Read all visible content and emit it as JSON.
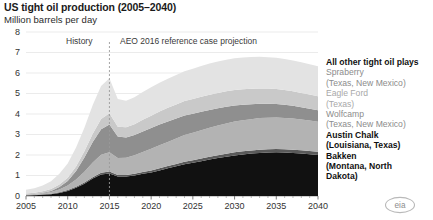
{
  "header": {
    "title": "US tight oil production (2005–2040)",
    "subtitle": "Million barrels per day"
  },
  "annotations": {
    "history": "History",
    "projection": "AEO 2016 reference case projection",
    "divider_year": 2015
  },
  "branding": {
    "logo_text": "eia"
  },
  "legend": [
    {
      "label": "All other tight oil plays",
      "sublabel": "",
      "color": "#e3e3e3",
      "tone": "dark"
    },
    {
      "label": "Spraberry",
      "sublabel": "(Texas, New Mexico)",
      "color": "#c9c9c9",
      "tone": "light"
    },
    {
      "label": "Eagle Ford",
      "sublabel": "(Texas)",
      "color": "#8f8f8f",
      "tone": "lighter"
    },
    {
      "label": "Wolfcamp",
      "sublabel": "(Texas, New Mexico)",
      "color": "#b3b3b3",
      "tone": "light"
    },
    {
      "label": "Austin Chalk",
      "sublabel": "(Louisiana, Texas)",
      "color": "#5a5a5a",
      "tone": "dark"
    },
    {
      "label": "Bakken",
      "sublabel": "(Montana, North Dakota)",
      "color": "#111111",
      "tone": "dark"
    }
  ],
  "chart_data": {
    "type": "area",
    "stacked": true,
    "title": "US tight oil production (2005–2040)",
    "subtitle": "Million barrels per day",
    "xlabel": "",
    "ylabel": "Million barrels per day",
    "xlim": [
      2005,
      2040
    ],
    "ylim": [
      0,
      8
    ],
    "yticks": [
      0,
      1,
      2,
      3,
      4,
      5,
      6,
      7,
      8
    ],
    "xticks": [
      2005,
      2010,
      2015,
      2020,
      2025,
      2030,
      2035,
      2040
    ],
    "grid": true,
    "legend_position": "right",
    "x": [
      2005,
      2006,
      2007,
      2008,
      2009,
      2010,
      2011,
      2012,
      2013,
      2014,
      2015,
      2016,
      2017,
      2018,
      2019,
      2020,
      2021,
      2022,
      2023,
      2024,
      2025,
      2026,
      2027,
      2028,
      2029,
      2030,
      2031,
      2032,
      2033,
      2034,
      2035,
      2036,
      2037,
      2038,
      2039,
      2040
    ],
    "series": [
      {
        "name": "Bakken",
        "color": "#111111",
        "values": [
          0.03,
          0.04,
          0.06,
          0.09,
          0.15,
          0.25,
          0.4,
          0.6,
          0.85,
          1.05,
          1.1,
          0.95,
          0.95,
          1.0,
          1.08,
          1.15,
          1.25,
          1.35,
          1.45,
          1.55,
          1.62,
          1.7,
          1.78,
          1.85,
          1.92,
          1.98,
          2.03,
          2.07,
          2.1,
          2.12,
          2.13,
          2.12,
          2.1,
          2.07,
          2.04,
          2.0
        ]
      },
      {
        "name": "Austin Chalk",
        "color": "#5a5a5a",
        "values": [
          0.01,
          0.01,
          0.02,
          0.02,
          0.03,
          0.04,
          0.05,
          0.06,
          0.07,
          0.08,
          0.09,
          0.08,
          0.08,
          0.09,
          0.09,
          0.1,
          0.1,
          0.11,
          0.11,
          0.12,
          0.12,
          0.13,
          0.13,
          0.14,
          0.14,
          0.15,
          0.15,
          0.15,
          0.16,
          0.16,
          0.16,
          0.16,
          0.16,
          0.16,
          0.16,
          0.16
        ]
      },
      {
        "name": "Wolfcamp",
        "color": "#b3b3b3",
        "values": [
          0.02,
          0.03,
          0.05,
          0.08,
          0.14,
          0.22,
          0.35,
          0.52,
          0.72,
          0.88,
          0.95,
          0.82,
          0.84,
          0.9,
          0.98,
          1.05,
          1.12,
          1.18,
          1.24,
          1.3,
          1.34,
          1.38,
          1.42,
          1.45,
          1.48,
          1.5,
          1.52,
          1.53,
          1.54,
          1.54,
          1.54,
          1.53,
          1.52,
          1.5,
          1.48,
          1.46
        ]
      },
      {
        "name": "Eagle Ford",
        "color": "#8f8f8f",
        "values": [
          0.01,
          0.02,
          0.03,
          0.06,
          0.12,
          0.22,
          0.42,
          0.7,
          1.0,
          1.25,
          1.35,
          1.05,
          0.98,
          0.98,
          1.0,
          1.02,
          1.02,
          1.0,
          0.98,
          0.96,
          0.93,
          0.9,
          0.87,
          0.84,
          0.81,
          0.78,
          0.75,
          0.72,
          0.7,
          0.68,
          0.66,
          0.64,
          0.62,
          0.6,
          0.58,
          0.56
        ]
      },
      {
        "name": "Spraberry",
        "color": "#c9c9c9",
        "values": [
          0.05,
          0.06,
          0.07,
          0.09,
          0.12,
          0.16,
          0.22,
          0.3,
          0.4,
          0.5,
          0.55,
          0.48,
          0.5,
          0.53,
          0.57,
          0.6,
          0.63,
          0.66,
          0.68,
          0.7,
          0.72,
          0.73,
          0.74,
          0.75,
          0.76,
          0.76,
          0.76,
          0.76,
          0.75,
          0.74,
          0.73,
          0.72,
          0.71,
          0.7,
          0.69,
          0.68
        ]
      },
      {
        "name": "All other tight oil plays",
        "color": "#e3e3e3",
        "values": [
          0.18,
          0.22,
          0.28,
          0.38,
          0.52,
          0.7,
          0.92,
          1.15,
          1.4,
          1.6,
          1.7,
          1.35,
          1.3,
          1.32,
          1.35,
          1.38,
          1.4,
          1.42,
          1.44,
          1.46,
          1.48,
          1.5,
          1.52,
          1.53,
          1.54,
          1.55,
          1.55,
          1.55,
          1.54,
          1.53,
          1.52,
          1.51,
          1.5,
          1.49,
          1.48,
          1.47
        ]
      }
    ]
  }
}
